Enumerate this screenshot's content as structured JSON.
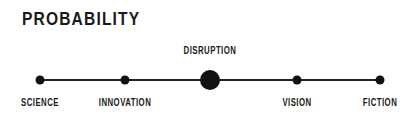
{
  "title": "PROBABILITY",
  "spectrum": {
    "nodes": [
      {
        "label": "SCIENCE",
        "x": 40,
        "size": "small",
        "label_position": "below"
      },
      {
        "label": "INNOVATION",
        "x": 125,
        "size": "small",
        "label_position": "below"
      },
      {
        "label": "DISRUPTION",
        "x": 210,
        "size": "large",
        "label_position": "above"
      },
      {
        "label": "VISION",
        "x": 297,
        "size": "small",
        "label_position": "below"
      },
      {
        "label": "FICTION",
        "x": 380,
        "size": "small",
        "label_position": "below"
      }
    ]
  },
  "colors": {
    "ink": "#111111",
    "background": "#ffffff"
  }
}
